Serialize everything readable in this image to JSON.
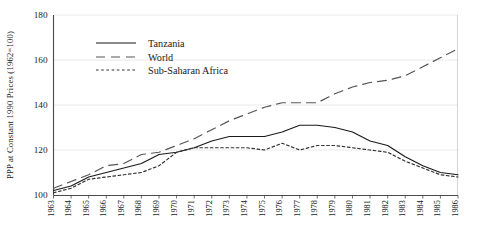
{
  "chart_data": {
    "type": "line",
    "title": "",
    "xlabel": "",
    "ylabel": "PPP at Constant 1990 Prices (1962=100)",
    "x": [
      1963,
      1964,
      1965,
      1966,
      1967,
      1968,
      1969,
      1970,
      1971,
      1972,
      1973,
      1974,
      1975,
      1976,
      1977,
      1978,
      1979,
      1980,
      1981,
      1982,
      1983,
      1984,
      1985,
      1986
    ],
    "xlim": [
      1963,
      1986
    ],
    "ylim": [
      100,
      180
    ],
    "yticks": [
      100,
      120,
      140,
      160,
      180
    ],
    "xticklabels": [
      "1963",
      "1964",
      "1965",
      "1966",
      "1967",
      "1968",
      "1969",
      "1970",
      "1971",
      "1972",
      "1973",
      "1974",
      "1975",
      "1976",
      "1977",
      "1978",
      "1979",
      "1980",
      "1981",
      "1982",
      "1983",
      "1984",
      "1985",
      "1986"
    ],
    "grid": "horizontal",
    "legend_position": "upper-left-inside",
    "series": [
      {
        "name": "Tanzania",
        "style": "solid",
        "color": "#1a1a1a",
        "values": [
          102,
          104,
          108,
          110,
          112,
          114,
          118,
          119,
          121,
          124,
          126,
          126,
          126,
          128,
          131,
          131,
          130,
          128,
          124,
          122,
          117,
          113,
          110,
          109
        ]
      },
      {
        "name": "World",
        "style": "dashed",
        "color": "#555555",
        "values": [
          103,
          106,
          109,
          113,
          114,
          118,
          119,
          122,
          125,
          129,
          133,
          136,
          139,
          141,
          141,
          141,
          145,
          148,
          150,
          151,
          153,
          157,
          161,
          165
        ]
      },
      {
        "name": "Sub-Saharan Africa",
        "style": "dotted",
        "color": "#333333",
        "values": [
          101,
          103,
          107,
          108,
          109,
          110,
          113,
          119,
          121,
          121,
          121,
          121,
          120,
          123,
          120,
          122,
          122,
          121,
          120,
          119,
          115,
          112,
          109,
          108
        ]
      }
    ]
  },
  "legend": {
    "items": [
      {
        "label": "Tanzania"
      },
      {
        "label": "World"
      },
      {
        "label": "Sub-Saharan Africa"
      }
    ]
  }
}
